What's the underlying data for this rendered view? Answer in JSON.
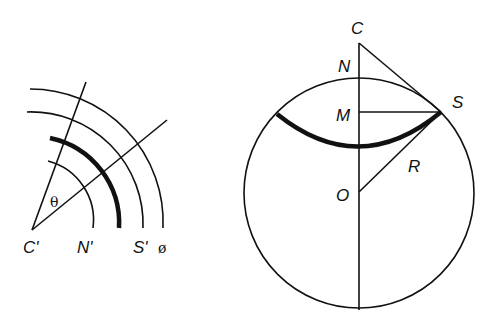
{
  "left_diagram": {
    "labels": {
      "center": "C'",
      "inner_arc": "N'",
      "outer_arc": "S'",
      "phi": "ø",
      "angle": "θ"
    }
  },
  "right_diagram": {
    "labels": {
      "apex": "C",
      "north": "N",
      "mid": "M",
      "point": "S",
      "center": "O",
      "radius": "R"
    }
  },
  "colors": {
    "stroke": "#111111",
    "background": "#ffffff"
  }
}
